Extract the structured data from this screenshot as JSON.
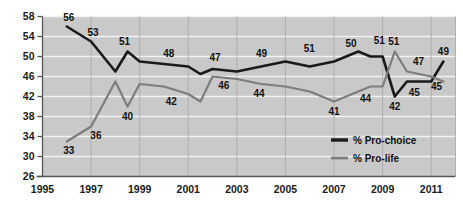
{
  "chart_data": {
    "type": "line",
    "title": "",
    "xlabel": "",
    "ylabel": "",
    "xlim": [
      1995,
      2012
    ],
    "ylim": [
      26,
      58
    ],
    "grid": true,
    "legend_position": "inside-bottom-right",
    "x_ticks": [
      "1995",
      "1997",
      "1999",
      "2001",
      "2003",
      "2005",
      "2007",
      "2009",
      "2011"
    ],
    "y_ticks": [
      "26",
      "30",
      "34",
      "38",
      "42",
      "46",
      "50",
      "54",
      "58"
    ],
    "x": [
      1996,
      1997,
      1998,
      1998.5,
      1999,
      2000,
      2001,
      2001.5,
      2002,
      2003,
      2004,
      2005,
      2006,
      2007,
      2008,
      2008.5,
      2009,
      2009.5,
      2010,
      2010.5,
      2011,
      2011.5
    ],
    "series": [
      {
        "name": "% Pro-choice",
        "color": "#1a1a1a",
        "values": [
          56,
          53,
          47,
          51,
          49,
          48.5,
          48,
          46.5,
          47.5,
          47,
          48,
          49,
          48,
          49,
          51,
          50,
          50,
          42,
          45,
          45,
          45,
          49
        ]
      },
      {
        "name": "% Pro-life",
        "color": "#7d7d7d",
        "values": [
          33,
          36,
          45,
          40,
          44.5,
          44,
          42.5,
          41,
          46,
          45.5,
          44.5,
          44,
          43,
          41,
          43,
          44,
          44,
          51,
          47,
          46.5,
          46,
          45
        ]
      }
    ],
    "point_labels": [
      {
        "text": "56",
        "x": 1996.0,
        "y": 56,
        "dx": 2,
        "dy": -6,
        "series": "% Pro-choice"
      },
      {
        "text": "53",
        "x": 1997.0,
        "y": 53,
        "dx": 2,
        "dy": -6,
        "series": "% Pro-choice"
      },
      {
        "text": "51",
        "x": 1998.5,
        "y": 51,
        "dx": -3,
        "dy": -7,
        "series": "% Pro-choice"
      },
      {
        "text": "48",
        "x": 2000.2,
        "y": 48.5,
        "dx": 0,
        "dy": -7,
        "series": "% Pro-choice"
      },
      {
        "text": "47",
        "x": 2002.1,
        "y": 47.5,
        "dx": 0,
        "dy": -8,
        "series": "% Pro-choice"
      },
      {
        "text": "49",
        "x": 2004.1,
        "y": 48.4,
        "dx": -2,
        "dy": -8,
        "series": "% Pro-choice"
      },
      {
        "text": "51",
        "x": 2005.9,
        "y": 49.2,
        "dx": 2,
        "dy": -9,
        "series": "% Pro-choice"
      },
      {
        "text": "50",
        "x": 2007.7,
        "y": 50.3,
        "dx": 0,
        "dy": -8,
        "series": "% Pro-choice"
      },
      {
        "text": "51",
        "x": 2008.7,
        "y": 51,
        "dx": 4,
        "dy": -8,
        "series": "% Pro-choice"
      },
      {
        "text": "42",
        "x": 2009.5,
        "y": 42,
        "dx": 0,
        "dy": 13,
        "series": "% Pro-choice"
      },
      {
        "text": "45",
        "x": 2010.3,
        "y": 45,
        "dx": 0,
        "dy": 14,
        "series": "% Pro-choice"
      },
      {
        "text": "49",
        "x": 2011.5,
        "y": 49,
        "dx": 0,
        "dy": -7,
        "series": "% Pro-choice"
      },
      {
        "text": "33",
        "x": 1996.0,
        "y": 33,
        "dx": 2,
        "dy": 12,
        "series": "% Pro-life"
      },
      {
        "text": "36",
        "x": 1997.2,
        "y": 36,
        "dx": 0,
        "dy": 12,
        "series": "% Pro-life"
      },
      {
        "text": "40",
        "x": 1998.5,
        "y": 40,
        "dx": 0,
        "dy": 13,
        "series": "% Pro-life"
      },
      {
        "text": "42",
        "x": 2000.3,
        "y": 43,
        "dx": 0,
        "dy": 13,
        "series": "% Pro-life"
      },
      {
        "text": "46",
        "x": 2002.3,
        "y": 46,
        "dx": 4,
        "dy": 12,
        "series": "% Pro-life"
      },
      {
        "text": "44",
        "x": 2004.0,
        "y": 44.5,
        "dx": -2,
        "dy": 13,
        "series": "% Pro-life"
      },
      {
        "text": "41",
        "x": 2007.0,
        "y": 41,
        "dx": 0,
        "dy": 13,
        "series": "% Pro-life"
      },
      {
        "text": "44",
        "x": 2008.3,
        "y": 43.6,
        "dx": 0,
        "dy": 13,
        "series": "% Pro-life"
      },
      {
        "text": "51",
        "x": 2009.5,
        "y": 51,
        "dx": -1,
        "dy": -7,
        "series": "% Pro-life"
      },
      {
        "text": "47",
        "x": 2010.4,
        "y": 47,
        "dx": 2,
        "dy": -7,
        "series": "% Pro-life"
      },
      {
        "text": "45",
        "x": 2011.3,
        "y": 46,
        "dx": -2,
        "dy": 13,
        "series": "% Pro-life"
      }
    ]
  },
  "legend": {
    "items": [
      {
        "label": "% Pro-choice",
        "color": "#1a1a1a"
      },
      {
        "label": "% Pro-life",
        "color": "#7d7d7d"
      }
    ]
  },
  "colors": {
    "plot_background": "#c9c9c9",
    "gridline": "#f2f2f2",
    "axis": "#555555",
    "pro_choice": "#1a1a1a",
    "pro_life": "#7d7d7d",
    "page_background": "#ffffff"
  }
}
